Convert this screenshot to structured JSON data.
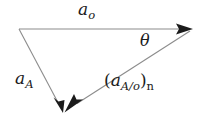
{
  "diagram": {
    "background_color": "#ffffff",
    "line_color": "#8c8c8c",
    "arrow_color": "#1b1b1b",
    "text_color": "#1b1b1b",
    "vectors": [
      {
        "id": "a-o",
        "label_base": "a",
        "label_subscript": "o",
        "from": [
          19,
          29
        ],
        "to": [
          192,
          29
        ],
        "arrow_at": "end"
      },
      {
        "id": "a-A",
        "label_base": "a",
        "label_subscript": "A",
        "from": [
          19,
          29
        ],
        "to": [
          62,
          112
        ],
        "arrow_at": "end"
      },
      {
        "id": "a-A-over-o-n",
        "label_open_paren": "(",
        "label_base": "a",
        "label_subscript": "A/o",
        "label_close_paren": ")",
        "label_outer_subscript": "n",
        "from": [
          192,
          29
        ],
        "to": [
          62,
          112
        ],
        "arrow_at": "end"
      }
    ],
    "angle": {
      "id": "theta",
      "symbol": "θ",
      "between": [
        "a-o",
        "a-A-over-o-n"
      ],
      "vertex": [
        192,
        29
      ]
    }
  }
}
